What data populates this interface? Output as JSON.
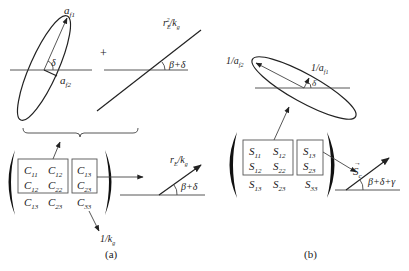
{
  "panel_a": {
    "caption": "(a)",
    "ellipse_labels": {
      "major_axis": "a",
      "major_sub": "f1",
      "minor_axis": "a",
      "minor_sub": "f2",
      "angle": "δ"
    },
    "plus_sign": "+",
    "line_label_top": {
      "base": "r",
      "sub": "E",
      "sup": "2",
      "rest": "/k",
      "rest_sub": "g"
    },
    "line_angle": "β+δ",
    "matrix": {
      "box1": [
        [
          "C11",
          "C12"
        ],
        [
          "C12",
          "C22"
        ]
      ],
      "box1_cells": {
        "r0c0": "C",
        "r0c0s": "11",
        "r0c1": "C",
        "r0c1s": "12",
        "r1c0": "C",
        "r1c0s": "12",
        "r1c1": "C",
        "r1c1s": "22"
      },
      "box2_cells": {
        "r0": "C",
        "r0s": "13",
        "r1": "C",
        "r1s": "23"
      },
      "bottom_row": {
        "c0": "C",
        "c0s": "13",
        "c1": "C",
        "c1s": "23",
        "c2": "C",
        "c2s": "33"
      }
    },
    "c33_label": {
      "base": "1/k",
      "sub": "g"
    },
    "result_line_label": {
      "base": "r",
      "sub": "E",
      "rest": "/k",
      "rest_sub": "g"
    },
    "result_angle": "β+δ"
  },
  "panel_b": {
    "caption": "(b)",
    "ellipse_labels": {
      "minor": "1/a",
      "minor_sub": "f2",
      "major": "1/a",
      "major_sub": "f1",
      "angle": "δ"
    },
    "matrix": {
      "box1_cells": {
        "r0c0": "S",
        "r0c0s": "11",
        "r0c1": "S",
        "r0c1s": "12",
        "r1c0": "S",
        "r1c0s": "12",
        "r1c1": "S",
        "r1c1s": "22"
      },
      "box2_cells": {
        "r0": "S",
        "r0s": "13",
        "r1": "S",
        "r1s": "23"
      },
      "bottom_row": {
        "c0": "S",
        "c0s": "13",
        "c1": "S",
        "c1s": "23",
        "c2": "S",
        "c2s": "33"
      }
    },
    "vector_label": {
      "base": "S",
      "sub": "c",
      "arrow": "→"
    },
    "result_angle": "β+δ+γ"
  }
}
